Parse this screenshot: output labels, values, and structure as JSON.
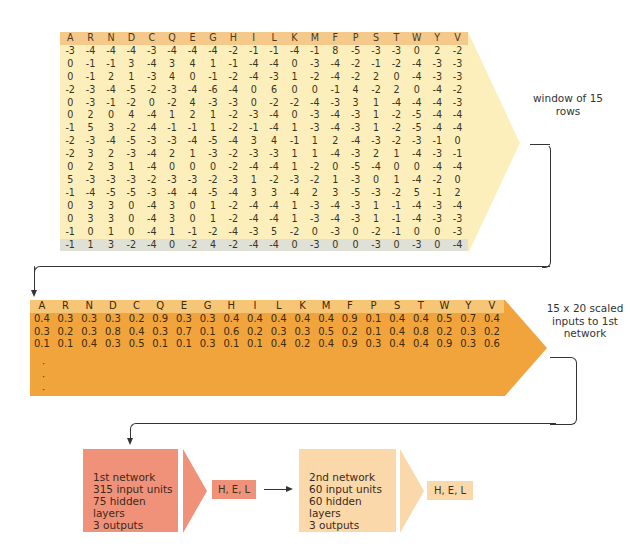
{
  "window_table": {
    "columns": [
      "A",
      "R",
      "N",
      "D",
      "C",
      "Q",
      "E",
      "G",
      "H",
      "I",
      "L",
      "K",
      "M",
      "F",
      "P",
      "S",
      "T",
      "W",
      "Y",
      "V"
    ],
    "rows": [
      [
        -3,
        -4,
        -4,
        -4,
        -3,
        -4,
        -4,
        -4,
        -2,
        -1,
        -1,
        -4,
        -1,
        8,
        -5,
        -3,
        -3,
        0,
        2,
        -2
      ],
      [
        0,
        -1,
        -1,
        3,
        -4,
        3,
        4,
        1,
        -1,
        -4,
        -4,
        0,
        -3,
        -4,
        -2,
        -1,
        -2,
        -4,
        -3,
        -3
      ],
      [
        0,
        -1,
        2,
        1,
        -3,
        4,
        0,
        -1,
        -2,
        -4,
        -3,
        1,
        -2,
        -4,
        -2,
        2,
        0,
        -4,
        -3,
        -3
      ],
      [
        -2,
        -3,
        -4,
        -5,
        -2,
        -3,
        -4,
        -6,
        -4,
        0,
        6,
        0,
        0,
        -1,
        4,
        -2,
        2,
        0,
        -4,
        -2
      ],
      [
        0,
        -3,
        -1,
        -2,
        0,
        -2,
        4,
        -3,
        -3,
        0,
        -2,
        -2,
        -4,
        -3,
        3,
        1,
        -4,
        -4,
        -4,
        -3
      ],
      [
        0,
        2,
        0,
        4,
        -4,
        1,
        2,
        1,
        -2,
        -3,
        -4,
        0,
        -3,
        -4,
        -3,
        1,
        -2,
        -5,
        -4,
        -4
      ],
      [
        -1,
        5,
        3,
        -2,
        -4,
        -1,
        -1,
        1,
        -2,
        -1,
        -4,
        1,
        -3,
        -4,
        -3,
        1,
        -2,
        -5,
        -4,
        -4
      ],
      [
        -2,
        -3,
        -4,
        -5,
        -3,
        -3,
        -4,
        -5,
        -4,
        3,
        4,
        -1,
        1,
        2,
        -4,
        -3,
        -2,
        -3,
        -1,
        0
      ],
      [
        -2,
        3,
        2,
        -3,
        -4,
        2,
        1,
        -3,
        -2,
        -3,
        -3,
        1,
        1,
        -4,
        -3,
        2,
        1,
        -4,
        -3,
        -1
      ],
      [
        0,
        2,
        3,
        1,
        -4,
        0,
        0,
        0,
        -2,
        -4,
        -4,
        1,
        -2,
        0,
        -5,
        -4,
        0,
        0,
        -4,
        -4
      ],
      [
        5,
        -3,
        -3,
        -3,
        -2,
        -3,
        -3,
        -2,
        -3,
        1,
        -2,
        -3,
        -2,
        1,
        -3,
        0,
        1,
        -4,
        -2,
        0
      ],
      [
        -1,
        -4,
        -5,
        -5,
        -3,
        -4,
        -4,
        -5,
        -4,
        3,
        3,
        -4,
        2,
        3,
        -5,
        -3,
        -2,
        5,
        -1,
        2
      ],
      [
        0,
        3,
        3,
        0,
        -4,
        3,
        0,
        1,
        -2,
        -4,
        -4,
        1,
        -3,
        -4,
        -3,
        1,
        -1,
        -4,
        -3,
        -4
      ],
      [
        0,
        3,
        3,
        0,
        -4,
        3,
        0,
        1,
        -2,
        -4,
        -4,
        1,
        -3,
        -4,
        -3,
        1,
        -1,
        -4,
        -3,
        -3
      ],
      [
        -1,
        0,
        1,
        0,
        -4,
        1,
        -1,
        -2,
        -4,
        -3,
        5,
        -2,
        0,
        -3,
        0,
        -2,
        -1,
        0,
        0,
        -3
      ],
      [
        -1,
        1,
        3,
        -2,
        -4,
        0,
        -2,
        4,
        -2,
        -4,
        -4,
        0,
        -3,
        0,
        0,
        -3,
        0,
        -3,
        0,
        -4
      ]
    ],
    "label": "window of 15 rows"
  },
  "scaled_table": {
    "columns": [
      "A",
      "R",
      "N",
      "D",
      "C",
      "Q",
      "E",
      "G",
      "H",
      "I",
      "L",
      "K",
      "M",
      "F",
      "P",
      "S",
      "T",
      "W",
      "Y",
      "V"
    ],
    "rows": [
      [
        "0.4",
        "0.3",
        "0.3",
        "0.3",
        "0.2",
        "0.9",
        "0.3",
        "0.3",
        "0.4",
        "0.4",
        "0.4",
        "0.4",
        "0.4",
        "0.9",
        "0.1",
        "0.4",
        "0.4",
        "0.5",
        "0.7",
        "0.4"
      ],
      [
        "0.3",
        "0.2",
        "0.3",
        "0.8",
        "0.4",
        "0.3",
        "0.7",
        "0.1",
        "0.6",
        "0.2",
        "0.3",
        "0.3",
        "0.5",
        "0.2",
        "0.1",
        "0.4",
        "0.8",
        "0.2",
        "0.3",
        "0.2"
      ],
      [
        "0.1",
        "0.1",
        "0.4",
        "0.3",
        "0.5",
        "0.1",
        "0.1",
        "0.3",
        "0.1",
        "0.1",
        "0.4",
        "0.2",
        "0.4",
        "0.9",
        "0.3",
        "0.4",
        "0.4",
        "0.9",
        "0.3",
        "0.6"
      ]
    ],
    "ellipsis": [
      "·",
      "·",
      "·"
    ],
    "label": "15 x 20 scaled inputs to 1st network"
  },
  "network1": {
    "lines": [
      "1st network",
      "315 input units",
      "75 hidden layers",
      "3 outputs"
    ],
    "output": "H, E, L"
  },
  "network2": {
    "lines": [
      "2nd network",
      "60 input units",
      "60 hidden layers",
      "3 outputs"
    ],
    "output": "H, E, L"
  },
  "colors": {
    "window_header": "#f4c98a",
    "window_body": "#fcefbc",
    "window_last_row": "#dfe0d6",
    "scaled_body": "#f2a43c",
    "scaled_header": "#f7c576",
    "network1": "#f0927a",
    "network2": "#fbd8a9"
  }
}
